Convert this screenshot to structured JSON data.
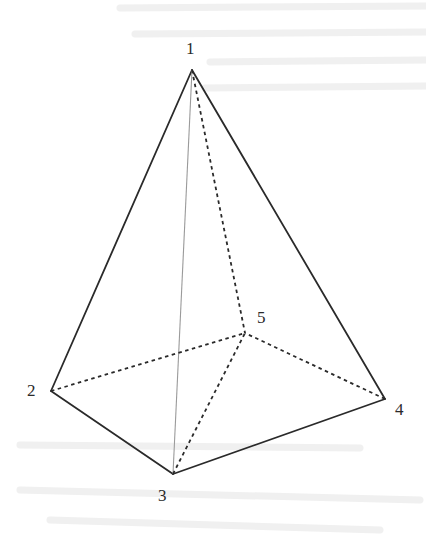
{
  "figure": {
    "vertices": [
      {
        "id": "1",
        "label": "1",
        "x": 192,
        "y": 70,
        "label_x": 186,
        "label_y": 54
      },
      {
        "id": "2",
        "label": "2",
        "x": 51,
        "y": 391,
        "label_x": 27,
        "label_y": 396
      },
      {
        "id": "3",
        "label": "3",
        "x": 173,
        "y": 474,
        "label_x": 158,
        "label_y": 501
      },
      {
        "id": "4",
        "label": "4",
        "x": 385,
        "y": 399,
        "label_x": 395,
        "label_y": 415
      },
      {
        "id": "5",
        "label": "5",
        "x": 245,
        "y": 333,
        "label_x": 257,
        "label_y": 323
      }
    ],
    "edges": [
      {
        "from": "1",
        "to": "2",
        "style": "solid"
      },
      {
        "from": "1",
        "to": "4",
        "style": "solid"
      },
      {
        "from": "2",
        "to": "3",
        "style": "solid"
      },
      {
        "from": "3",
        "to": "4",
        "style": "solid"
      },
      {
        "from": "1",
        "to": "3",
        "style": "thin"
      },
      {
        "from": "1",
        "to": "5",
        "style": "dashed"
      },
      {
        "from": "2",
        "to": "5",
        "style": "dashed"
      },
      {
        "from": "3",
        "to": "5",
        "style": "dashed"
      },
      {
        "from": "4",
        "to": "5",
        "style": "dashed"
      }
    ],
    "colors": {
      "line": "#2a2a2a",
      "thin_line": "#9a9a9a",
      "background": "#ffffff",
      "bleed_through": "#e4e4e4"
    }
  }
}
